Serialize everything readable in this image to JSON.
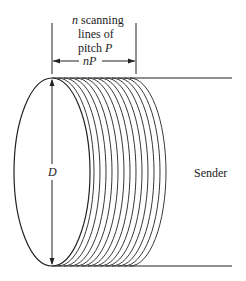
{
  "labels": {
    "scan_line1": "n scanning",
    "scan_line1_var": "n",
    "scan_line1_text": " scanning",
    "scan_line2": "lines of",
    "scan_line3_text": "pitch ",
    "scan_line3_var": "P",
    "width_dim": "nP",
    "diameter": "D",
    "sender": "Sender"
  },
  "geometry": {
    "num_scan_lines": 13,
    "diameter_label": "D",
    "length_label": "nP"
  },
  "colors": {
    "stroke": "#222222",
    "background": "#ffffff"
  }
}
